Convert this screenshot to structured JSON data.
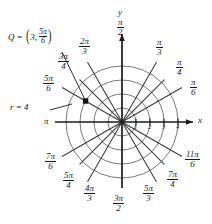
{
  "figure": {
    "type": "polar-grid-diagram",
    "background": "#ffffff",
    "ink_color": "#1a1a1a",
    "grid_color": "#555555",
    "center": {
      "x": 122,
      "y": 122
    },
    "unit_px": 14,
    "circles": [
      1,
      2,
      3,
      4
    ],
    "axes": {
      "x_label": "x",
      "y_label": "y",
      "x_ticks": [
        "1",
        "2",
        "3",
        "4"
      ],
      "x_arrow": true,
      "y_arrow": true
    },
    "spoke_count": 12,
    "angle_labels": [
      {
        "id": "pi-over-2",
        "num": "π",
        "den": "2",
        "deg": 90
      },
      {
        "id": "pi-over-3",
        "num": "π",
        "den": "3",
        "deg": 60
      },
      {
        "id": "pi-over-4",
        "num": "π",
        "den": "4",
        "deg": 45
      },
      {
        "id": "pi-over-6",
        "num": "π",
        "den": "6",
        "deg": 30
      },
      {
        "id": "two-pi-over-3",
        "num": "2π",
        "den": "3",
        "deg": 120
      },
      {
        "id": "three-pi-over-4",
        "num": "3π",
        "den": "4",
        "deg": 135
      },
      {
        "id": "five-pi-over-6",
        "num": "5π",
        "den": "6",
        "deg": 150
      },
      {
        "id": "pi",
        "num": "π",
        "den": "",
        "deg": 180
      },
      {
        "id": "seven-pi-over-6",
        "num": "7π",
        "den": "6",
        "deg": 210
      },
      {
        "id": "five-pi-over-4",
        "num": "5π",
        "den": "4",
        "deg": 225
      },
      {
        "id": "four-pi-over-3",
        "num": "4π",
        "den": "3",
        "deg": 240
      },
      {
        "id": "three-pi-over-2",
        "num": "3π",
        "den": "2",
        "deg": 270
      },
      {
        "id": "five-pi-over-3",
        "num": "5π",
        "den": "3",
        "deg": 300
      },
      {
        "id": "seven-pi-over-4",
        "num": "7π",
        "den": "4",
        "deg": 315
      },
      {
        "id": "eleven-pi-over-6",
        "num": "11π",
        "den": "6",
        "deg": 330
      }
    ],
    "annotations": {
      "point_q": {
        "name": "Q",
        "equals": "=",
        "radius": "3",
        "comma": ",",
        "angle_num": "5π",
        "angle_den": "6",
        "plot_r": 3,
        "plot_theta_deg": 150
      },
      "radius_note": {
        "text": "r = 4",
        "value": 4
      }
    }
  }
}
